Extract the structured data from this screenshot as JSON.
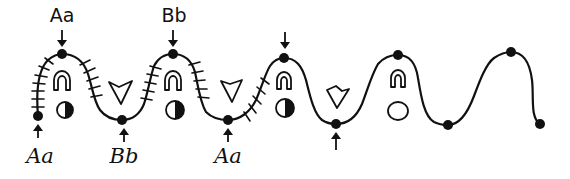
{
  "figure": {
    "stroke_color": "#111111",
    "background": "#ffffff"
  },
  "labels": {
    "top": [
      {
        "text": "Aa",
        "x": 62,
        "y": 4
      },
      {
        "text": "Bb",
        "x": 174,
        "y": 4
      }
    ],
    "bottom": [
      {
        "text": "Aa",
        "x": 38,
        "y": 146
      },
      {
        "text": "Bb",
        "x": 124,
        "y": 146
      },
      {
        "text": "Aa",
        "x": 228,
        "y": 146
      }
    ]
  },
  "nodes": [
    {
      "id": "end-left",
      "x": 38,
      "y": 116,
      "arrow": "up",
      "label": "Aa"
    },
    {
      "id": "peak-1",
      "x": 62,
      "y": 54,
      "arrow": "down",
      "label": "Aa"
    },
    {
      "id": "trough-1",
      "x": 122,
      "y": 120,
      "arrow": "up",
      "label": "Bb"
    },
    {
      "id": "peak-2",
      "x": 173,
      "y": 54,
      "arrow": "down",
      "label": "Bb"
    },
    {
      "id": "trough-2",
      "x": 228,
      "y": 120,
      "arrow": "up",
      "label": "Aa"
    },
    {
      "id": "peak-3",
      "x": 284,
      "y": 58,
      "arrow": "down",
      "label": ""
    },
    {
      "id": "trough-3",
      "x": 336,
      "y": 124,
      "arrow": "up",
      "label": ""
    },
    {
      "id": "peak-4",
      "x": 398,
      "y": 55,
      "arrow": "none",
      "label": ""
    },
    {
      "id": "trough-4",
      "x": 448,
      "y": 125,
      "arrow": "none",
      "label": ""
    },
    {
      "id": "peak-5",
      "x": 511,
      "y": 52,
      "arrow": "none",
      "label": ""
    },
    {
      "id": "end-right",
      "x": 540,
      "y": 124,
      "arrow": "none",
      "label": ""
    }
  ],
  "symbols": {
    "horseshoes": [
      {
        "x": 62,
        "y": 88
      },
      {
        "x": 173,
        "y": 88
      },
      {
        "x": 284,
        "y": 87
      },
      {
        "x": 398,
        "y": 85
      }
    ],
    "v_shapes": [
      {
        "x": 120,
        "y": 93
      },
      {
        "x": 228,
        "y": 93
      },
      {
        "x": 336,
        "y": 96
      }
    ],
    "moons": [
      {
        "x": 65,
        "y": 110,
        "fill": "right-half",
        "radius": 8
      },
      {
        "x": 175,
        "y": 110,
        "fill": "right-half",
        "radius": 9
      },
      {
        "x": 285,
        "y": 108,
        "fill": "right-half",
        "radius": 9
      },
      {
        "x": 398,
        "y": 111,
        "fill": "none",
        "radius": 10
      }
    ]
  }
}
